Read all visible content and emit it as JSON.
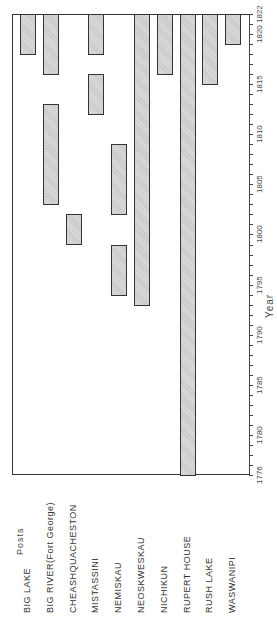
{
  "chart_data": {
    "type": "bar",
    "subtype": "timeline-gantt (rotated 90°)",
    "title": "",
    "xlabel": "Posts",
    "ylabel": "Year",
    "ylim": [
      1776,
      1822
    ],
    "y_ticks": [
      1776,
      1780,
      1785,
      1790,
      1795,
      1800,
      1805,
      1810,
      1815,
      1820,
      1822
    ],
    "grid": false,
    "categories": [
      "BIG LAKE",
      "BIG RIVER(Fort George)",
      "CHEASHQUACHESTON",
      "MISTASSINI",
      "NEMISKAU",
      "NEOSKWESKAU",
      "NICHIKUN",
      "RUPERT HOUSE",
      "RUSH LAKE",
      "WASWANIPI"
    ],
    "series": [
      {
        "name": "BIG LAKE",
        "intervals": [
          [
            1818,
            1822
          ]
        ]
      },
      {
        "name": "BIG RIVER(Fort George)",
        "intervals": [
          [
            1803,
            1813
          ],
          [
            1816,
            1822
          ]
        ]
      },
      {
        "name": "CHEASHQUACHESTON",
        "intervals": [
          [
            1799,
            1802
          ]
        ]
      },
      {
        "name": "MISTASSINI",
        "intervals": [
          [
            1812,
            1816
          ],
          [
            1818,
            1822
          ]
        ]
      },
      {
        "name": "NEMISKAU",
        "intervals": [
          [
            1794,
            1799
          ],
          [
            1802,
            1809
          ]
        ]
      },
      {
        "name": "NEOSKWESKAU",
        "intervals": [
          [
            1793,
            1822
          ]
        ]
      },
      {
        "name": "NICHIKUN",
        "intervals": [
          [
            1816,
            1822
          ]
        ]
      },
      {
        "name": "RUPERT HOUSE",
        "intervals": [
          [
            1776,
            1822
          ]
        ]
      },
      {
        "name": "RUSH LAKE",
        "intervals": [
          [
            1815,
            1822
          ]
        ]
      },
      {
        "name": "WASWANIPI",
        "intervals": [
          [
            1819,
            1822
          ]
        ]
      }
    ],
    "bar_color": "#c8c8c8",
    "border_color": "#333333"
  }
}
